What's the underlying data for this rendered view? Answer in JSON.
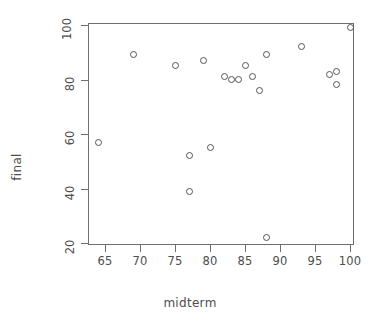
{
  "chart_data": {
    "type": "scatter",
    "title": "",
    "xlabel": "midterm",
    "ylabel": "final",
    "xlim": [
      62.5,
      101.5
    ],
    "ylim": [
      18,
      101
    ],
    "xticks": [
      65,
      70,
      75,
      80,
      85,
      90,
      95,
      100
    ],
    "xticklabels": [
      "65",
      "70",
      "75",
      "80",
      "85",
      "90",
      "95",
      "100"
    ],
    "yticks": [
      20,
      40,
      60,
      80,
      100
    ],
    "yticklabels": [
      "20",
      "40",
      "60",
      "80",
      "100"
    ],
    "grid": false,
    "legend": null,
    "marker": "open-circle",
    "marker_color": "#545454",
    "points": [
      {
        "x": 64,
        "y": 57
      },
      {
        "x": 69,
        "y": 89
      },
      {
        "x": 75,
        "y": 85
      },
      {
        "x": 77,
        "y": 52
      },
      {
        "x": 77,
        "y": 39
      },
      {
        "x": 79,
        "y": 87
      },
      {
        "x": 80,
        "y": 55
      },
      {
        "x": 82,
        "y": 81
      },
      {
        "x": 83,
        "y": 80
      },
      {
        "x": 84,
        "y": 80
      },
      {
        "x": 85,
        "y": 85
      },
      {
        "x": 86,
        "y": 81
      },
      {
        "x": 87,
        "y": 76
      },
      {
        "x": 88,
        "y": 89
      },
      {
        "x": 88,
        "y": 22
      },
      {
        "x": 93,
        "y": 92
      },
      {
        "x": 97,
        "y": 82
      },
      {
        "x": 98,
        "y": 83
      },
      {
        "x": 98,
        "y": 78
      },
      {
        "x": 100,
        "y": 99
      }
    ]
  }
}
